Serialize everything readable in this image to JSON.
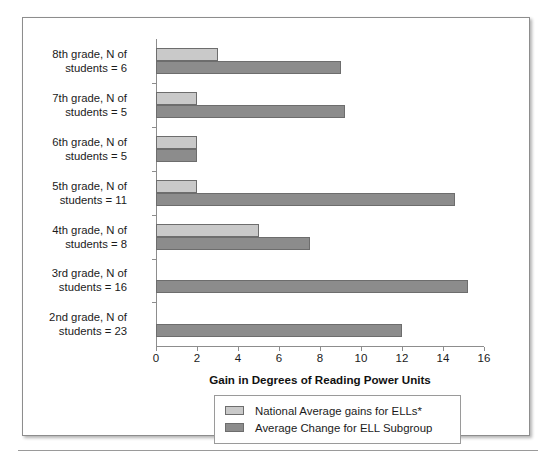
{
  "chart_data": {
    "type": "bar",
    "orientation": "horizontal",
    "title": "",
    "xlabel": "Gain in Degrees of Reading Power Units",
    "ylabel": "",
    "xlim": [
      0,
      16
    ],
    "xticks": [
      0,
      2,
      4,
      6,
      8,
      10,
      12,
      14,
      16
    ],
    "grid": false,
    "legend_position": "bottom",
    "categories": [
      "8th grade, N of\nstudents = 6",
      "7th grade, N of\nstudents = 5",
      "6th grade, N of\nstudents = 5",
      "5th grade, N of\nstudents = 11",
      "4th grade, N of\nstudents = 8",
      "3rd grade, N of\nstudents = 16",
      "2nd grade, N of\nstudents = 23"
    ],
    "series": [
      {
        "name": "National Average gains for ELLs*",
        "color": "#c9c9c9",
        "values": [
          3,
          2,
          2,
          2,
          5,
          0,
          0
        ]
      },
      {
        "name": "Average Change for ELL Subgroup",
        "color": "#8c8c8c",
        "values": [
          9,
          9.2,
          2,
          14.6,
          7.5,
          15.2,
          12
        ]
      }
    ]
  },
  "legend": {
    "items": [
      {
        "label": "National Average gains for ELLs*",
        "color": "#c9c9c9"
      },
      {
        "label": "Average Change for ELL Subgroup",
        "color": "#8c8c8c"
      }
    ]
  }
}
